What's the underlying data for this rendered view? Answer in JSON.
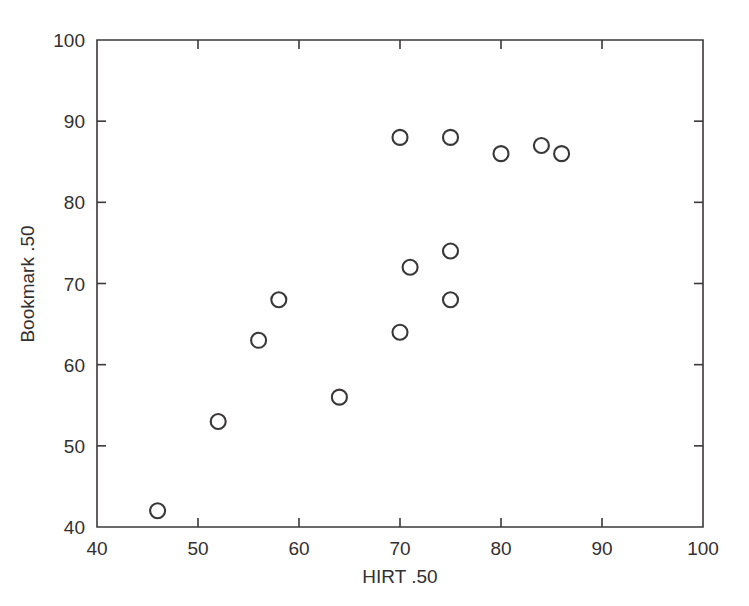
{
  "chart_data": {
    "type": "scatter",
    "title": "",
    "xlabel": "HIRT  .50",
    "ylabel": "Bookmark  .50",
    "xlim": [
      40,
      100
    ],
    "ylim": [
      40,
      100
    ],
    "xticks": [
      40,
      50,
      60,
      70,
      80,
      90,
      100
    ],
    "yticks": [
      40,
      50,
      60,
      70,
      80,
      90,
      100
    ],
    "xtick_labels": [
      "40",
      "50",
      "60",
      "70",
      "80",
      "90",
      "100"
    ],
    "ytick_labels": [
      "40",
      "50",
      "60",
      "70",
      "80",
      "90",
      "100"
    ],
    "grid": false,
    "legend": false,
    "marker": "open-circle",
    "marker_color": "#3a3738",
    "series": [
      {
        "name": "observations",
        "points": [
          {
            "x": 46,
            "y": 42
          },
          {
            "x": 52,
            "y": 53
          },
          {
            "x": 56,
            "y": 63
          },
          {
            "x": 58,
            "y": 68
          },
          {
            "x": 64,
            "y": 56
          },
          {
            "x": 70,
            "y": 64
          },
          {
            "x": 70,
            "y": 88
          },
          {
            "x": 71,
            "y": 72
          },
          {
            "x": 75,
            "y": 68
          },
          {
            "x": 75,
            "y": 74
          },
          {
            "x": 75,
            "y": 88
          },
          {
            "x": 80,
            "y": 86
          },
          {
            "x": 84,
            "y": 87
          },
          {
            "x": 86,
            "y": 86
          }
        ]
      }
    ]
  },
  "figure": {
    "background": "#ffffff",
    "axis_color": "#3b3839"
  }
}
